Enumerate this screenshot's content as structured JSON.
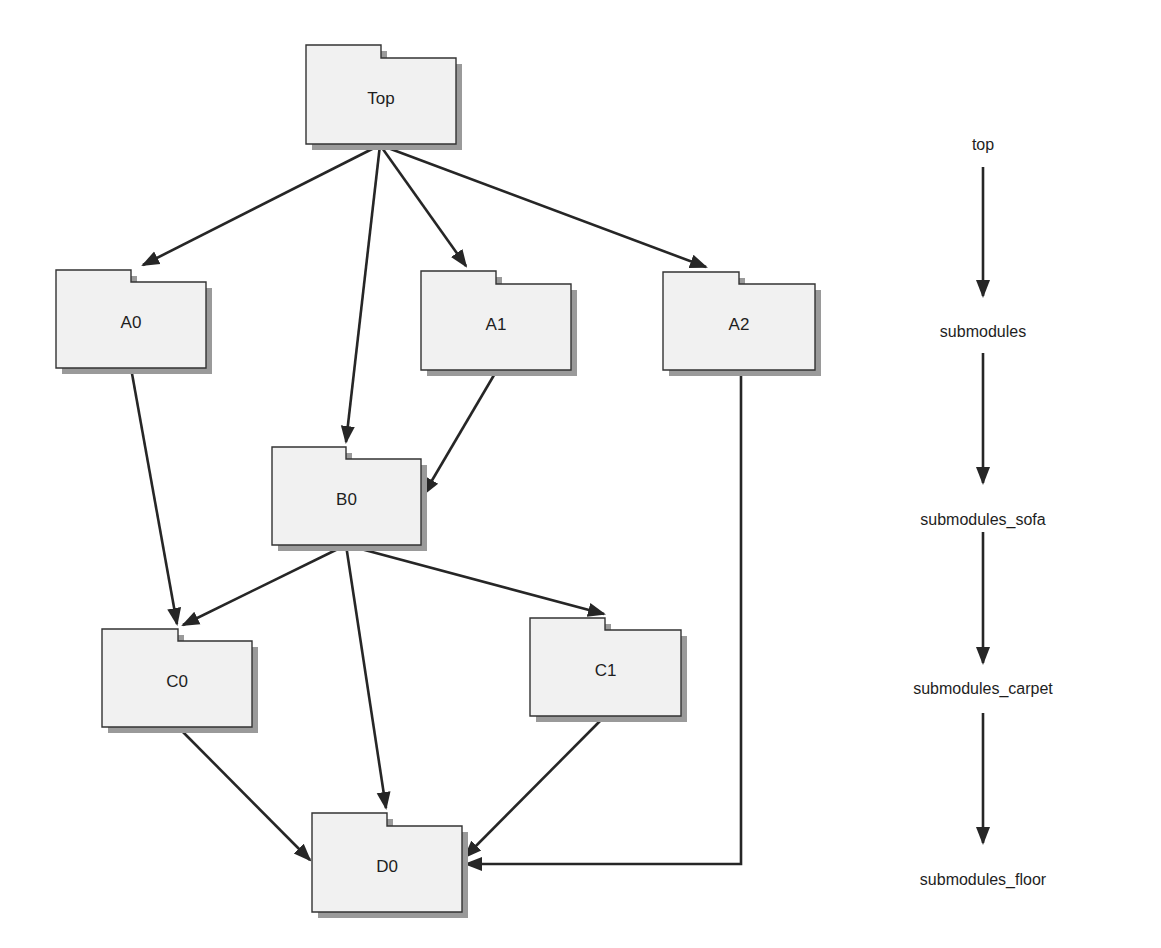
{
  "diagram": {
    "nodes": [
      {
        "id": "top",
        "label": "Top",
        "x": 306,
        "y": 45,
        "w": 150,
        "h": 99,
        "tab_w": 75,
        "tab_h": 13
      },
      {
        "id": "a0",
        "label": "A0",
        "x": 56,
        "y": 270,
        "w": 150,
        "h": 98,
        "tab_w": 75,
        "tab_h": 12
      },
      {
        "id": "a1",
        "label": "A1",
        "x": 421,
        "y": 271,
        "w": 150,
        "h": 99,
        "tab_w": 75,
        "tab_h": 13
      },
      {
        "id": "a2",
        "label": "A2",
        "x": 663,
        "y": 272,
        "w": 152,
        "h": 98,
        "tab_w": 76,
        "tab_h": 12
      },
      {
        "id": "b0",
        "label": "B0",
        "x": 272,
        "y": 447,
        "w": 149,
        "h": 98,
        "tab_w": 74,
        "tab_h": 12
      },
      {
        "id": "c0",
        "label": "C0",
        "x": 102,
        "y": 629,
        "w": 150,
        "h": 98,
        "tab_w": 76,
        "tab_h": 12
      },
      {
        "id": "c1",
        "label": "C1",
        "x": 530,
        "y": 618,
        "w": 151,
        "h": 98,
        "tab_w": 75,
        "tab_h": 12
      },
      {
        "id": "d0",
        "label": "D0",
        "x": 312,
        "y": 813,
        "w": 150,
        "h": 99,
        "tab_w": 75,
        "tab_h": 13
      }
    ],
    "edges": [
      {
        "from": "top",
        "to": "a0",
        "points": [
          [
            380,
            145
          ],
          [
            143,
            265
          ]
        ]
      },
      {
        "from": "top",
        "to": "b0",
        "points": [
          [
            380,
            145
          ],
          [
            346,
            442
          ]
        ]
      },
      {
        "from": "top",
        "to": "a1",
        "points": [
          [
            380,
            145
          ],
          [
            466,
            266
          ]
        ]
      },
      {
        "from": "top",
        "to": "a2",
        "points": [
          [
            380,
            145
          ],
          [
            706,
            267
          ]
        ]
      },
      {
        "from": "a0",
        "to": "c0",
        "points": [
          [
            131,
            368
          ],
          [
            177,
            624
          ]
        ]
      },
      {
        "from": "a1",
        "to": "b0",
        "points": [
          [
            497,
            370
          ],
          [
            424,
            494
          ]
        ]
      },
      {
        "from": "a2",
        "to": "d0",
        "points": [
          [
            741,
            370
          ],
          [
            741,
            864
          ],
          [
            466,
            864
          ]
        ]
      },
      {
        "from": "b0",
        "to": "c0",
        "points": [
          [
            346,
            545
          ],
          [
            183,
            625
          ]
        ]
      },
      {
        "from": "b0",
        "to": "d0",
        "points": [
          [
            346,
            545
          ],
          [
            386,
            808
          ]
        ]
      },
      {
        "from": "b0",
        "to": "c1",
        "points": [
          [
            346,
            545
          ],
          [
            604,
            614
          ]
        ]
      },
      {
        "from": "c0",
        "to": "d0",
        "points": [
          [
            178,
            727
          ],
          [
            310,
            860
          ]
        ]
      },
      {
        "from": "c1",
        "to": "d0",
        "points": [
          [
            605,
            716
          ],
          [
            465,
            857
          ]
        ]
      }
    ]
  },
  "hierarchy": {
    "x": 983,
    "levels": [
      {
        "label": "top",
        "y": 146
      },
      {
        "label": "submodules",
        "y": 333
      },
      {
        "label": "submodules_sofa",
        "y": 521
      },
      {
        "label": "submodules_carpet",
        "y": 690
      },
      {
        "label": "submodules_floor",
        "y": 881
      }
    ],
    "arrows": [
      {
        "y1": 167,
        "y2": 296
      },
      {
        "y1": 353,
        "y2": 483
      },
      {
        "y1": 532,
        "y2": 663
      },
      {
        "y1": 713,
        "y2": 843
      }
    ]
  },
  "colors": {
    "background": "#ffffff",
    "node_fill": "#f1f1f1",
    "node_stroke": "#333333",
    "shadow": "#9a9a9a",
    "edge": "#262626",
    "text": "#1e1e1e"
  }
}
